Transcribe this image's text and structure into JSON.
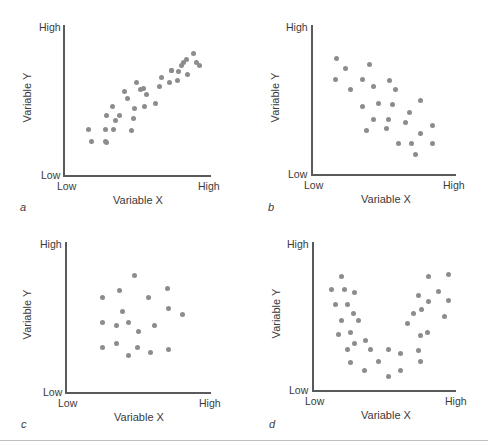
{
  "figure": {
    "separator_color": "#bdbdbd",
    "dot_color": "#8c8c8c",
    "axis_color": "#5a5a5a"
  },
  "chart_data": [
    {
      "type": "scatter",
      "panel": "a",
      "title": "",
      "xlabel": "Variable X",
      "ylabel": "Variable Y",
      "x_ticks": [
        "Low",
        "High"
      ],
      "y_ticks": [
        "Low",
        "High"
      ],
      "xlim": [
        0,
        100
      ],
      "ylim": [
        0,
        100
      ],
      "grid": false,
      "description": "Positive linear correlation",
      "points": [
        [
          17,
          31
        ],
        [
          19,
          23
        ],
        [
          28,
          31
        ],
        [
          29,
          22
        ],
        [
          28,
          23
        ],
        [
          34,
          31
        ],
        [
          29,
          40
        ],
        [
          35,
          37
        ],
        [
          33,
          46
        ],
        [
          38,
          40
        ],
        [
          47,
          38
        ],
        [
          48,
          45
        ],
        [
          46,
          30
        ],
        [
          43,
          51
        ],
        [
          41,
          56
        ],
        [
          55,
          46
        ],
        [
          52,
          57
        ],
        [
          56,
          54
        ],
        [
          62,
          48
        ],
        [
          49,
          62
        ],
        [
          54,
          58
        ],
        [
          65,
          59
        ],
        [
          72,
          62
        ],
        [
          77,
          63
        ],
        [
          66,
          65
        ],
        [
          73,
          70
        ],
        [
          84,
          67
        ],
        [
          78,
          69
        ],
        [
          80,
          73
        ],
        [
          92,
          73
        ],
        [
          73,
          70
        ],
        [
          81,
          75
        ],
        [
          90,
          75
        ],
        [
          88,
          81
        ],
        [
          83,
          77
        ]
      ]
    },
    {
      "type": "scatter",
      "panel": "b",
      "title": "",
      "xlabel": "Variable X",
      "ylabel": "Variable Y",
      "x_ticks": [
        "Low",
        "High"
      ],
      "y_ticks": [
        "Low",
        "High"
      ],
      "xlim": [
        0,
        100
      ],
      "ylim": [
        0,
        100
      ],
      "grid": false,
      "description": "Negative linear correlation",
      "points": [
        [
          17,
          78
        ],
        [
          23,
          71
        ],
        [
          40,
          74
        ],
        [
          16,
          64
        ],
        [
          35,
          64
        ],
        [
          54,
          63
        ],
        [
          27,
          57
        ],
        [
          43,
          59
        ],
        [
          58,
          57
        ],
        [
          75,
          50
        ],
        [
          35,
          46
        ],
        [
          46,
          48
        ],
        [
          56,
          47
        ],
        [
          68,
          42
        ],
        [
          43,
          37
        ],
        [
          53,
          37
        ],
        [
          65,
          35
        ],
        [
          84,
          33
        ],
        [
          38,
          30
        ],
        [
          52,
          31
        ],
        [
          75,
          28
        ],
        [
          60,
          21
        ],
        [
          69,
          21
        ],
        [
          84,
          21
        ],
        [
          72,
          14
        ]
      ]
    },
    {
      "type": "scatter",
      "panel": "c",
      "title": "",
      "xlabel": "Variable X",
      "ylabel": "Variable Y",
      "x_ticks": [
        "Low",
        "High"
      ],
      "y_ticks": [
        "Low",
        "High"
      ],
      "xlim": [
        0,
        100
      ],
      "ylim": [
        0,
        100
      ],
      "grid": false,
      "description": "No correlation",
      "points": [
        [
          47,
          78
        ],
        [
          37,
          68
        ],
        [
          70,
          69
        ],
        [
          25,
          63
        ],
        [
          57,
          63
        ],
        [
          71,
          56
        ],
        [
          39,
          54
        ],
        [
          80,
          52
        ],
        [
          25,
          47
        ],
        [
          35,
          45
        ],
        [
          43,
          47
        ],
        [
          61,
          45
        ],
        [
          50,
          41
        ],
        [
          25,
          30
        ],
        [
          35,
          33
        ],
        [
          49,
          30
        ],
        [
          58,
          27
        ],
        [
          71,
          29
        ],
        [
          43,
          25
        ]
      ]
    },
    {
      "type": "scatter",
      "panel": "d",
      "title": "",
      "xlabel": "Variable X",
      "ylabel": "Variable Y",
      "x_ticks": [
        "Low",
        "High"
      ],
      "y_ticks": [
        "Low",
        "High"
      ],
      "xlim": [
        0,
        100
      ],
      "ylim": [
        0,
        100
      ],
      "grid": false,
      "description": "Curvilinear (U-shaped) relationship",
      "points": [
        [
          20,
          77
        ],
        [
          13,
          68
        ],
        [
          22,
          68
        ],
        [
          29,
          66
        ],
        [
          16,
          58
        ],
        [
          24,
          58
        ],
        [
          28,
          52
        ],
        [
          20,
          47
        ],
        [
          32,
          47
        ],
        [
          18,
          38
        ],
        [
          26,
          39
        ],
        [
          29,
          32
        ],
        [
          37,
          34
        ],
        [
          24,
          28
        ],
        [
          40,
          28
        ],
        [
          53,
          28
        ],
        [
          26,
          19
        ],
        [
          46,
          20
        ],
        [
          36,
          14
        ],
        [
          53,
          10
        ],
        [
          61,
          25
        ],
        [
          61,
          14
        ],
        [
          74,
          27
        ],
        [
          75,
          20
        ],
        [
          80,
          39
        ],
        [
          75,
          37
        ],
        [
          66,
          45
        ],
        [
          70,
          52
        ],
        [
          81,
          60
        ],
        [
          92,
          50
        ],
        [
          76,
          55
        ],
        [
          74,
          64
        ],
        [
          88,
          67
        ],
        [
          95,
          61
        ],
        [
          81,
          77
        ],
        [
          95,
          78
        ]
      ]
    }
  ],
  "panels": [
    {
      "letter": "a",
      "y_high": "High",
      "y_low": "Low",
      "x_low": "Low",
      "x_high": "High",
      "xlabel": "Variable X",
      "ylabel": "Variable Y"
    },
    {
      "letter": "b",
      "y_high": "High",
      "y_low": "Low",
      "x_low": "Low",
      "x_high": "High",
      "xlabel": "Variable X",
      "ylabel": "Variable Y"
    },
    {
      "letter": "c",
      "y_high": "High",
      "y_low": "Low",
      "x_low": "Low",
      "x_high": "High",
      "xlabel": "Variable X",
      "ylabel": "Variable Y"
    },
    {
      "letter": "d",
      "y_high": "High",
      "y_low": "Low",
      "x_low": "Low",
      "x_high": "High",
      "xlabel": "Variable X",
      "ylabel": "Variable Y"
    }
  ]
}
